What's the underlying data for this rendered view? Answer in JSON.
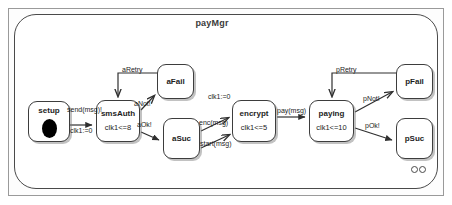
{
  "diagram": {
    "title": "payMgr",
    "type": "uml-state-machine",
    "corner_marker": "double-circle"
  },
  "states": [
    {
      "id": "setup",
      "name": "setup",
      "invariant": "",
      "has_initial_blob": true,
      "x": 28,
      "y": 101,
      "w": 42,
      "h": 41
    },
    {
      "id": "smsAuth",
      "name": "smsAuth",
      "invariant": "clk1<=8",
      "has_initial_blob": false,
      "x": 96,
      "y": 100,
      "w": 44,
      "h": 42
    },
    {
      "id": "aFail",
      "name": "aFail",
      "invariant": "",
      "has_initial_blob": false,
      "x": 157,
      "y": 64,
      "w": 37,
      "h": 35
    },
    {
      "id": "aSuc",
      "name": "aSuc",
      "invariant": "",
      "has_initial_blob": false,
      "x": 163,
      "y": 118,
      "w": 37,
      "h": 41
    },
    {
      "id": "encrypt",
      "name": "encrypt",
      "invariant": "clk1<=5",
      "has_initial_blob": false,
      "x": 232,
      "y": 100,
      "w": 44,
      "h": 42
    },
    {
      "id": "paying",
      "name": "paying",
      "invariant": "clk1<=10",
      "has_initial_blob": false,
      "x": 309,
      "y": 100,
      "w": 45,
      "h": 42
    },
    {
      "id": "pFail",
      "name": "pFail",
      "invariant": "",
      "has_initial_blob": false,
      "x": 396,
      "y": 64,
      "w": 37,
      "h": 35
    },
    {
      "id": "pSuc",
      "name": "pSuc",
      "invariant": "",
      "has_initial_blob": false,
      "x": 396,
      "y": 118,
      "w": 37,
      "h": 41
    }
  ],
  "transitions": [
    {
      "id": "t-setup-smsauth",
      "from": "setup",
      "to": "smsAuth",
      "label_top": "send(msg)!",
      "label_bottom": "clk1:=0"
    },
    {
      "id": "t-afail-smsauth",
      "from": "aFail",
      "to": "smsAuth",
      "label_top": "aRetry",
      "label_bottom": ""
    },
    {
      "id": "t-smsauth-afail",
      "from": "smsAuth",
      "to": "aFail",
      "label_top": "aNot!",
      "label_bottom": ""
    },
    {
      "id": "t-smsauth-asuc",
      "from": "smsAuth",
      "to": "aSuc",
      "label_top": "aOk!",
      "label_bottom": ""
    },
    {
      "id": "t-asuc-encrypt-enc",
      "from": "aSuc",
      "to": "encrypt",
      "label_top": "enc(msg)",
      "label_bottom": ""
    },
    {
      "id": "t-asuc-encrypt-start",
      "from": "aSuc",
      "to": "encrypt",
      "label_top": "start(msg)",
      "label_bottom": ""
    },
    {
      "id": "t-encrypt-reset",
      "from": "encrypt",
      "to": "encrypt",
      "label_top": "clk1:=0",
      "label_bottom": ""
    },
    {
      "id": "t-encrypt-paying",
      "from": "encrypt",
      "to": "paying",
      "label_top": "pay(msg)",
      "label_bottom": ""
    },
    {
      "id": "t-pfail-paying",
      "from": "pFail",
      "to": "paying",
      "label_top": "pRetry",
      "label_bottom": ""
    },
    {
      "id": "t-paying-pfail",
      "from": "paying",
      "to": "pFail",
      "label_top": "pNot!",
      "label_bottom": ""
    },
    {
      "id": "t-paying-psuc",
      "from": "paying",
      "to": "pSuc",
      "label_top": "pOk!",
      "label_bottom": ""
    }
  ],
  "labels": {
    "send_msg": "send(msg)!",
    "clk1_reset_setup": "clk1:=0",
    "aRetry": "aRetry",
    "aNot": "aNot!",
    "aOk": "aOk!",
    "clk1_reset_encrypt": "clk1:=0",
    "enc_msg": "enc(msg)",
    "start_msg": "start(msg)",
    "pay_msg": "pay(msg)",
    "pRetry": "pRetry",
    "pNot": "pNot!",
    "pOk": "pOk!"
  }
}
